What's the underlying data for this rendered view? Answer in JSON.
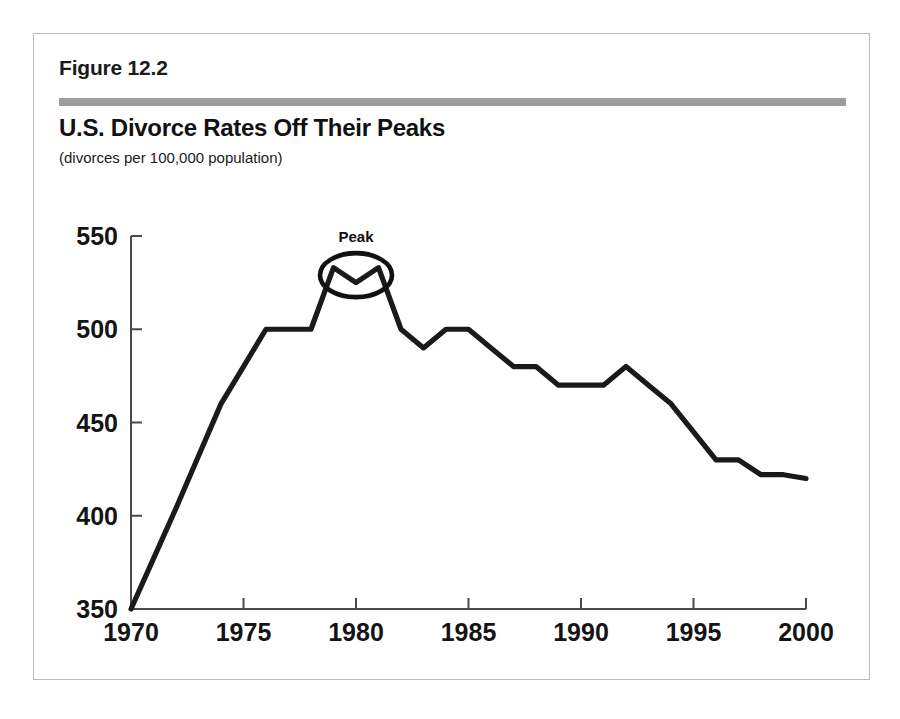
{
  "figure": {
    "number_label": "Figure 12.2",
    "title": "U.S. Divorce Rates Off Their Peaks",
    "subtitle": "(divorces per 100,000 population)",
    "frame_border_color": "#b9b9b9",
    "rule_bar_color": "#9d9d9d",
    "background_color": "#ffffff"
  },
  "chart_data": {
    "type": "line",
    "title": "U.S. Divorce Rates Off Their Peaks",
    "subtitle": "(divorces per 100,000 population)",
    "xlabel": "",
    "ylabel": "",
    "xlim": [
      1970,
      2000
    ],
    "ylim": [
      350,
      550
    ],
    "grid": false,
    "legend": "none",
    "line_color": "#1a1a1a",
    "xticks": [
      "1970",
      "1975",
      "1980",
      "1985",
      "1990",
      "1995",
      "2000"
    ],
    "xtick_values": [
      1970,
      1975,
      1980,
      1985,
      1990,
      1995,
      2000
    ],
    "yticks": [
      "350",
      "400",
      "450",
      "500",
      "550"
    ],
    "ytick_values": [
      350,
      400,
      450,
      500,
      550
    ],
    "x": [
      1970,
      1971,
      1972,
      1973,
      1974,
      1975,
      1976,
      1977,
      1978,
      1979,
      1980,
      1981,
      1982,
      1983,
      1984,
      1985,
      1986,
      1987,
      1988,
      1989,
      1990,
      1991,
      1992,
      1993,
      1994,
      1995,
      1996,
      1997,
      1998,
      1999,
      2000
    ],
    "values": [
      350,
      377,
      404,
      432,
      460,
      480,
      500,
      500,
      500,
      533,
      525,
      533,
      500,
      490,
      500,
      500,
      490,
      480,
      480,
      470,
      470,
      470,
      480,
      470,
      460,
      445,
      430,
      430,
      422,
      422,
      420
    ],
    "series": [
      {
        "name": "U.S. divorce rate",
        "values": [
          350,
          377,
          404,
          432,
          460,
          480,
          500,
          500,
          500,
          533,
          525,
          533,
          500,
          490,
          500,
          500,
          490,
          480,
          480,
          470,
          470,
          470,
          480,
          470,
          460,
          445,
          430,
          430,
          422,
          422,
          420
        ]
      }
    ],
    "annotations": [
      {
        "label": "Peak",
        "shape": "hand-drawn-ellipse",
        "x_center": 1980,
        "y_center": 529,
        "covers_years": [
          1979,
          1980,
          1981
        ]
      }
    ]
  }
}
